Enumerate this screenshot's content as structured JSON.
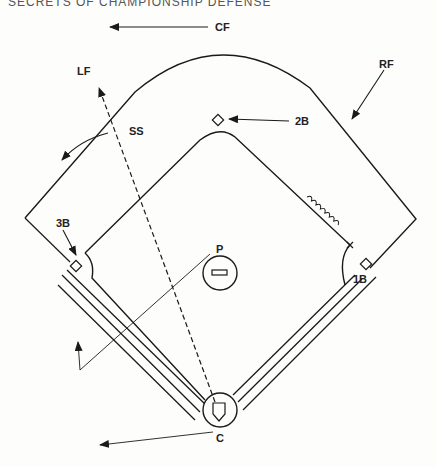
{
  "header": {
    "title": "SECRETS OF CHAMPIONSHIP DEFENSE",
    "page": ""
  },
  "diagram": {
    "labels": {
      "cf": "CF",
      "lf": "LF",
      "rf": "RF",
      "ss": "SS",
      "second_base": "2B",
      "third_base": "3B",
      "first_base": "1B",
      "pitcher": "P",
      "catcher": "C"
    },
    "colors": {
      "line": "#1a1a1a",
      "background": "#fdfdfb"
    }
  }
}
